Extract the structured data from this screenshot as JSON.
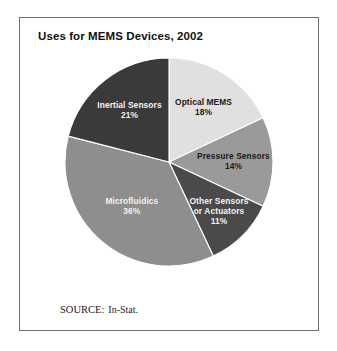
{
  "figure": {
    "title": "Uses for MEMS Devices, 2002",
    "source_prefix": "SOURCE:",
    "source_value": "In-Stat.",
    "frame_color": "#6f6f6f",
    "background_color": "#ffffff"
  },
  "chart_data": {
    "type": "pie",
    "title": "Uses for MEMS Devices, 2002",
    "xlabel": "",
    "ylabel": "",
    "units": "percent",
    "start_angle_deg": 0,
    "direction": "clockwise",
    "legend": "none",
    "grid": false,
    "categories": [
      "Optical MEMS",
      "Pressure Sensors",
      "Other Sensors or Actuators",
      "Microfluidics",
      "Inertial Sensors"
    ],
    "values": [
      18,
      14,
      11,
      36,
      21
    ],
    "total": 100,
    "slices": [
      {
        "label": "Optical MEMS",
        "label_lines": [
          "Optical MEMS",
          "18%"
        ],
        "value": 18,
        "value_text": "18%",
        "color": "#e0e0e0",
        "label_color": "#1a1a1a"
      },
      {
        "label": "Pressure Sensors",
        "label_lines": [
          "Pressure Sensors",
          "14%"
        ],
        "value": 14,
        "value_text": "14%",
        "color": "#9a9a9a",
        "label_color": "#1a1a1a"
      },
      {
        "label": "Other Sensors or Actuators",
        "label_lines": [
          "Other Sensors",
          "or Actuators",
          "11%"
        ],
        "value": 11,
        "value_text": "11%",
        "color": "#4a4a4a",
        "label_color": "#f2f2f2"
      },
      {
        "label": "Microfluidics",
        "label_lines": [
          "Microfluidics",
          "36%"
        ],
        "value": 36,
        "value_text": "36%",
        "color": "#8e8e8e",
        "label_color": "#f2f2f2"
      },
      {
        "label": "Inertial Sensors",
        "label_lines": [
          "Inertial Sensors",
          "21%"
        ],
        "value": 21,
        "value_text": "21%",
        "color": "#3a3a3a",
        "label_color": "#f2f2f2"
      }
    ]
  }
}
